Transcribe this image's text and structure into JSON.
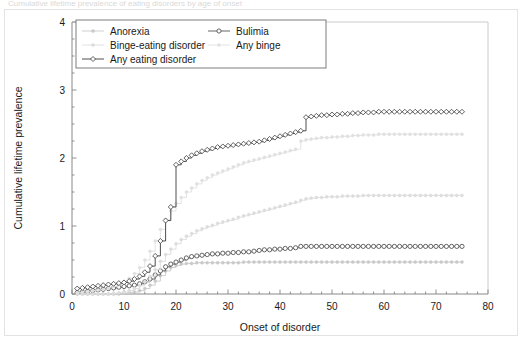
{
  "caption": {
    "text": "Cumulative lifetime prevalence of eating disorders by age of onset"
  },
  "chart_data": {
    "type": "line",
    "title": "",
    "xlabel": "Onset of disorder",
    "ylabel": "Cumulative lifetime prevalence",
    "xlim": [
      0,
      80
    ],
    "ylim": [
      0,
      4
    ],
    "xticks": [
      0,
      10,
      20,
      30,
      40,
      50,
      60,
      70,
      80
    ],
    "xtick_labels": [
      "0",
      "10",
      "20",
      "30",
      "40",
      "50",
      "60",
      "70",
      "80"
    ],
    "yticks": [
      0,
      1,
      2,
      3,
      4
    ],
    "ytick_labels": [
      "0",
      "1",
      "2",
      "3",
      "4"
    ],
    "x_minor_step": 2,
    "y_minor_step": 0.25,
    "grid": false,
    "legend_position": "top-left-inside",
    "step_style": "post",
    "x": [
      1,
      2,
      3,
      4,
      5,
      6,
      7,
      8,
      9,
      10,
      11,
      12,
      13,
      14,
      15,
      16,
      17,
      18,
      19,
      20,
      21,
      22,
      23,
      24,
      25,
      26,
      27,
      28,
      29,
      30,
      31,
      32,
      33,
      34,
      35,
      36,
      37,
      38,
      39,
      40,
      41,
      42,
      43,
      44,
      45,
      46,
      47,
      48,
      49,
      50,
      51,
      52,
      53,
      54,
      55,
      56,
      57,
      58,
      59,
      60,
      61,
      62,
      63,
      64,
      65,
      66,
      67,
      68,
      69,
      70,
      71,
      72,
      73,
      74,
      75
    ],
    "series": [
      {
        "name": "Anorexia",
        "color": "#c9c9c9",
        "marker": "dot",
        "values": [
          0.0,
          0.0,
          0.0,
          0.0,
          0.0,
          0.0,
          0.0,
          0.0,
          0.0,
          0.01,
          0.02,
          0.03,
          0.05,
          0.08,
          0.13,
          0.19,
          0.27,
          0.34,
          0.39,
          0.42,
          0.44,
          0.45,
          0.45,
          0.46,
          0.46,
          0.46,
          0.46,
          0.46,
          0.46,
          0.46,
          0.46,
          0.46,
          0.47,
          0.47,
          0.47,
          0.47,
          0.47,
          0.47,
          0.47,
          0.47,
          0.47,
          0.47,
          0.47,
          0.47,
          0.47,
          0.47,
          0.47,
          0.47,
          0.47,
          0.47,
          0.47,
          0.47,
          0.47,
          0.47,
          0.47,
          0.47,
          0.47,
          0.47,
          0.47,
          0.47,
          0.47,
          0.47,
          0.47,
          0.47,
          0.47,
          0.47,
          0.47,
          0.47,
          0.47,
          0.47,
          0.47,
          0.47,
          0.47,
          0.47,
          0.47
        ]
      },
      {
        "name": "Bulimia",
        "color": "#555555",
        "marker": "circle-filled",
        "values": [
          0.02,
          0.03,
          0.04,
          0.05,
          0.06,
          0.07,
          0.08,
          0.09,
          0.1,
          0.11,
          0.12,
          0.13,
          0.15,
          0.18,
          0.22,
          0.28,
          0.34,
          0.4,
          0.44,
          0.47,
          0.5,
          0.53,
          0.55,
          0.56,
          0.57,
          0.58,
          0.59,
          0.59,
          0.6,
          0.6,
          0.61,
          0.61,
          0.62,
          0.62,
          0.63,
          0.64,
          0.65,
          0.65,
          0.66,
          0.66,
          0.67,
          0.67,
          0.68,
          0.7,
          0.7,
          0.7,
          0.7,
          0.7,
          0.7,
          0.7,
          0.7,
          0.7,
          0.7,
          0.7,
          0.7,
          0.7,
          0.7,
          0.7,
          0.7,
          0.7,
          0.7,
          0.7,
          0.7,
          0.7,
          0.7,
          0.7,
          0.7,
          0.7,
          0.7,
          0.7,
          0.7,
          0.7,
          0.7,
          0.7,
          0.7
        ]
      },
      {
        "name": "Binge-eating disorder",
        "color": "#dcdcdc",
        "marker": "dot",
        "values": [
          0.0,
          0.0,
          0.0,
          0.0,
          0.0,
          0.0,
          0.0,
          0.01,
          0.02,
          0.03,
          0.05,
          0.08,
          0.12,
          0.18,
          0.26,
          0.36,
          0.48,
          0.58,
          0.66,
          0.74,
          0.8,
          0.85,
          0.89,
          0.93,
          0.96,
          0.99,
          1.01,
          1.04,
          1.06,
          1.08,
          1.1,
          1.13,
          1.15,
          1.17,
          1.19,
          1.21,
          1.23,
          1.25,
          1.27,
          1.29,
          1.31,
          1.33,
          1.35,
          1.38,
          1.4,
          1.41,
          1.42,
          1.42,
          1.43,
          1.43,
          1.43,
          1.44,
          1.44,
          1.44,
          1.44,
          1.45,
          1.45,
          1.45,
          1.45,
          1.45,
          1.45,
          1.45,
          1.45,
          1.45,
          1.45,
          1.45,
          1.45,
          1.45,
          1.45,
          1.45,
          1.45,
          1.45,
          1.45,
          1.45,
          1.45
        ]
      },
      {
        "name": "Any binge",
        "color": "#e0e0e0",
        "marker": "dot",
        "values": [
          0.02,
          0.03,
          0.04,
          0.05,
          0.06,
          0.07,
          0.09,
          0.11,
          0.14,
          0.18,
          0.23,
          0.3,
          0.39,
          0.5,
          0.63,
          0.78,
          0.95,
          1.1,
          1.22,
          1.33,
          1.42,
          1.5,
          1.56,
          1.62,
          1.67,
          1.71,
          1.75,
          1.78,
          1.81,
          1.84,
          1.87,
          1.9,
          1.93,
          1.95,
          1.97,
          1.99,
          2.01,
          2.03,
          2.05,
          2.07,
          2.09,
          2.11,
          2.13,
          2.25,
          2.27,
          2.28,
          2.29,
          2.3,
          2.3,
          2.31,
          2.31,
          2.32,
          2.32,
          2.33,
          2.33,
          2.34,
          2.34,
          2.34,
          2.35,
          2.35,
          2.35,
          2.35,
          2.35,
          2.35,
          2.35,
          2.35,
          2.35,
          2.35,
          2.35,
          2.35,
          2.35,
          2.35,
          2.35,
          2.35,
          2.35
        ]
      },
      {
        "name": "Any eating disorder",
        "color": "#3a3a3a",
        "marker": "diamond",
        "values": [
          0.08,
          0.09,
          0.1,
          0.11,
          0.12,
          0.13,
          0.14,
          0.15,
          0.16,
          0.17,
          0.19,
          0.22,
          0.26,
          0.32,
          0.41,
          0.56,
          0.78,
          1.08,
          1.28,
          1.9,
          1.95,
          2.0,
          2.04,
          2.07,
          2.1,
          2.12,
          2.14,
          2.16,
          2.17,
          2.18,
          2.19,
          2.2,
          2.21,
          2.22,
          2.23,
          2.24,
          2.26,
          2.28,
          2.3,
          2.32,
          2.34,
          2.36,
          2.38,
          2.4,
          2.6,
          2.61,
          2.62,
          2.63,
          2.63,
          2.64,
          2.64,
          2.65,
          2.65,
          2.66,
          2.66,
          2.67,
          2.67,
          2.67,
          2.68,
          2.68,
          2.68,
          2.68,
          2.68,
          2.68,
          2.68,
          2.68,
          2.68,
          2.68,
          2.68,
          2.68,
          2.68,
          2.68,
          2.68,
          2.68,
          2.68
        ]
      }
    ],
    "legend_entries": [
      {
        "label": "Anorexia",
        "color": "#c9c9c9",
        "marker": "dot"
      },
      {
        "label": "Bulimia",
        "color": "#555555",
        "marker": "circle-filled"
      },
      {
        "label": "Binge-eating disorder",
        "color": "#dcdcdc",
        "marker": "dot"
      },
      {
        "label": "Any binge",
        "color": "#e0e0e0",
        "marker": "dot"
      },
      {
        "label": "Any eating disorder",
        "color": "#3a3a3a",
        "marker": "diamond"
      }
    ]
  }
}
